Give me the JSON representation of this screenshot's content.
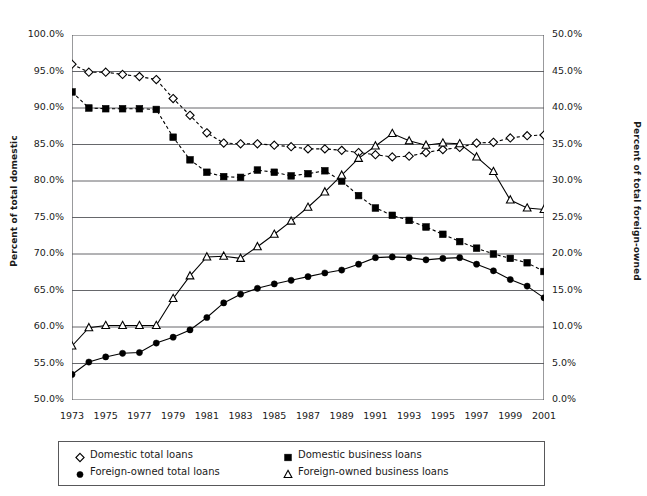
{
  "chart_data": {
    "type": "line",
    "title": "",
    "xlabel": "",
    "ylabel": "Percent of total domestic",
    "ylabel_right": "Percent of total foreign-owned",
    "grid": true,
    "legend_position": "bottom",
    "x": [
      1973,
      1974,
      1975,
      1976,
      1977,
      1978,
      1979,
      1980,
      1981,
      1982,
      1983,
      1984,
      1985,
      1986,
      1987,
      1988,
      1989,
      1990,
      1991,
      1992,
      1993,
      1994,
      1995,
      1996,
      1997,
      1998,
      1999,
      2000,
      2001
    ],
    "xtick_labels": [
      "1973",
      "1975",
      "1977",
      "1979",
      "1981",
      "1983",
      "1985",
      "1987",
      "1989",
      "1991",
      "1993",
      "1995",
      "1997",
      "1999",
      "2001"
    ],
    "xlim": [
      1973,
      2001
    ],
    "ylim": [
      50.0,
      100.0
    ],
    "ytick_labels": [
      "50.0%",
      "55.0%",
      "60.0%",
      "65.0%",
      "70.0%",
      "75.0%",
      "80.0%",
      "85.0%",
      "90.0%",
      "95.0%",
      "100.0%"
    ],
    "ylim_right": [
      0.0,
      50.0
    ],
    "ytick_labels_right": [
      "0.0%",
      "5.0%",
      "10.0%",
      "15.0%",
      "20.0%",
      "25.0%",
      "30.0%",
      "35.0%",
      "40.0%",
      "45.0%",
      "50.0%"
    ],
    "series": [
      {
        "name": "Domestic total loans",
        "axis": "left",
        "marker": "open-diamond",
        "line": "dashed",
        "color": "#000000",
        "values": [
          96.0,
          94.9,
          94.9,
          94.6,
          94.3,
          93.9,
          91.3,
          89.0,
          86.6,
          85.2,
          85.1,
          85.1,
          84.9,
          84.7,
          84.4,
          84.4,
          84.2,
          83.9,
          83.6,
          83.3,
          83.4,
          83.9,
          84.3,
          84.6,
          85.2,
          85.3,
          85.9,
          86.2,
          86.3
        ]
      },
      {
        "name": "Domestic business loans",
        "axis": "left",
        "marker": "filled-square",
        "line": "dashed",
        "color": "#000000",
        "values": [
          92.2,
          90.0,
          89.9,
          89.9,
          89.9,
          89.8,
          86.0,
          82.9,
          81.2,
          80.6,
          80.5,
          81.5,
          81.2,
          80.7,
          81.0,
          81.4,
          80.0,
          78.0,
          76.3,
          75.3,
          74.6,
          73.7,
          72.7,
          71.7,
          70.8,
          70.0,
          69.4,
          68.8,
          67.6
        ]
      },
      {
        "name": "Foreign-owned total loans",
        "axis": "right",
        "marker": "filled-circle",
        "line": "solid",
        "color": "#000000",
        "values": [
          3.5,
          5.2,
          5.9,
          6.4,
          6.5,
          7.8,
          8.6,
          9.6,
          11.3,
          13.3,
          14.5,
          15.3,
          15.9,
          16.4,
          16.9,
          17.4,
          17.8,
          18.6,
          19.5,
          19.6,
          19.5,
          19.2,
          19.4,
          19.5,
          18.6,
          17.7,
          16.5,
          15.6,
          14.0
        ]
      },
      {
        "name": "Foreign-owned business loans",
        "axis": "right",
        "marker": "open-triangle",
        "line": "solid",
        "color": "#000000",
        "values": [
          7.4,
          9.9,
          10.2,
          10.2,
          10.2,
          10.2,
          13.9,
          17.0,
          19.6,
          19.7,
          19.4,
          21.0,
          22.7,
          24.5,
          26.4,
          28.5,
          30.8,
          33.1,
          34.8,
          36.5,
          35.5,
          34.9,
          35.2,
          35.1,
          33.3,
          31.3,
          27.4,
          26.3,
          26.1
        ]
      }
    ]
  },
  "legend": {
    "entries": [
      {
        "label": "Domestic total loans",
        "marker": "open-diamond"
      },
      {
        "label": "Domestic business loans",
        "marker": "filled-square"
      },
      {
        "label": "Foreign-owned total loans",
        "marker": "filled-circle"
      },
      {
        "label": "Foreign-owned business loans",
        "marker": "open-triangle"
      }
    ]
  }
}
